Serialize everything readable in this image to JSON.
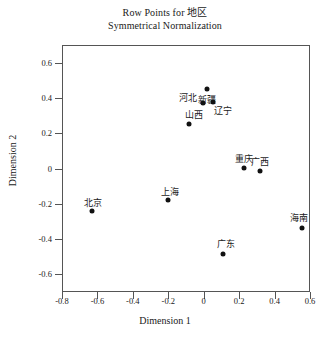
{
  "chart_data": {
    "type": "scatter",
    "title": "Row Points for 地区",
    "subtitle": "Symmetrical Normalization",
    "xlabel": "Dimension 1",
    "ylabel": "Dimension 2",
    "xlim": [
      -0.8,
      0.6
    ],
    "ylim": [
      -0.7,
      0.7
    ],
    "xticks": [
      -0.8,
      -0.6,
      -0.4,
      -0.2,
      0,
      0.2,
      0.4,
      0.6
    ],
    "xticklabels": [
      "-0.8",
      "-0.6",
      "-0.4",
      "-0.2",
      "0",
      "0.2",
      "0.4",
      "0.6"
    ],
    "yticks": [
      0.6,
      0.4,
      0.2,
      0,
      -0.2,
      -0.4,
      -0.6
    ],
    "yticklabels": [
      "0.6",
      "0.4",
      "0.2",
      "0",
      "-0.2",
      "-0.4",
      "-0.6"
    ],
    "grid": false,
    "legend": false,
    "marker_color": "#111111",
    "points": [
      {
        "label": "新疆",
        "x": 0.02,
        "y": 0.45,
        "label_dx": 0,
        "label_dy": -0.055
      },
      {
        "label": "河北",
        "x": -0.005,
        "y": 0.37,
        "label_dx": -0.085,
        "label_dy": 0.038
      },
      {
        "label": "辽宁",
        "x": 0.055,
        "y": 0.375,
        "label_dx": 0.055,
        "label_dy": -0.042
      },
      {
        "label": "山西",
        "x": -0.085,
        "y": 0.255,
        "label_dx": 0.028,
        "label_dy": 0.052
      },
      {
        "label": "重庆",
        "x": 0.225,
        "y": 0.005,
        "label_dx": 0.0,
        "label_dy": 0.052
      },
      {
        "label": "广西",
        "x": 0.315,
        "y": -0.015,
        "label_dx": 0.005,
        "label_dy": 0.055
      },
      {
        "label": "北京",
        "x": -0.63,
        "y": -0.24,
        "label_dx": 0.005,
        "label_dy": 0.052
      },
      {
        "label": "上海",
        "x": -0.2,
        "y": -0.18,
        "label_dx": 0.01,
        "label_dy": 0.052
      },
      {
        "label": "广东",
        "x": 0.11,
        "y": -0.485,
        "label_dx": 0.018,
        "label_dy": 0.06
      },
      {
        "label": "海南",
        "x": 0.555,
        "y": -0.335,
        "label_dx": -0.015,
        "label_dy": 0.06
      }
    ]
  }
}
